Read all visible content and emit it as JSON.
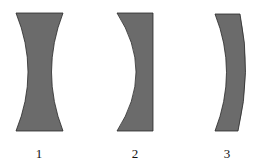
{
  "diagram": {
    "type": "lens-cross-sections",
    "fill_color": "#6b6b6b",
    "stroke_color": "#2a2a2a",
    "lenses": [
      {
        "id": 1,
        "label": "1",
        "shape": "biconcave"
      },
      {
        "id": 2,
        "label": "2",
        "shape": "plano-concave"
      },
      {
        "id": 3,
        "label": "3",
        "shape": "concave-meniscus"
      }
    ]
  }
}
